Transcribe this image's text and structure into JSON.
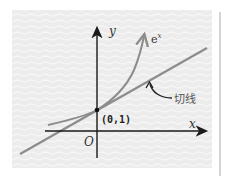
{
  "diagram": {
    "axes": {
      "x_label": "x",
      "y_label": "y",
      "origin_label": "O"
    },
    "curve_label": "e",
    "curve_label_sup": "x",
    "point_label": "(0,1)",
    "tangent_label": "切线",
    "colors": {
      "background": "#ececec",
      "axis": "#1a1a1a",
      "curve": "#8c8c8c",
      "tangent": "#8c8c8c",
      "point": "#111111"
    }
  }
}
